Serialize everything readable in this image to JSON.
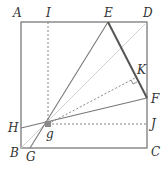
{
  "diagram": {
    "labels": {
      "A": "A",
      "I": "I",
      "E": "E",
      "D": "D",
      "K": "K",
      "F": "F",
      "J": "J",
      "C": "C",
      "H": "H",
      "g": "g",
      "B": "B",
      "G": "G"
    },
    "points": {
      "A": [
        21,
        22
      ],
      "B": [
        21,
        148
      ],
      "C": [
        147,
        148
      ],
      "D": [
        147,
        22
      ],
      "E": [
        108,
        22
      ],
      "F": [
        147,
        98
      ],
      "g": [
        48,
        124
      ],
      "H": [
        21,
        128
      ],
      "G": [
        30,
        148
      ],
      "I": [
        48,
        22
      ],
      "J": [
        147,
        124
      ],
      "K": [
        135,
        78
      ]
    },
    "colors": {
      "square": "#6f6f6f",
      "solid_line": "#777777",
      "thick_line": "#555555",
      "diagonal": "#cfcfcf",
      "dashed": "#777777",
      "point": "#8a8a8a"
    }
  }
}
